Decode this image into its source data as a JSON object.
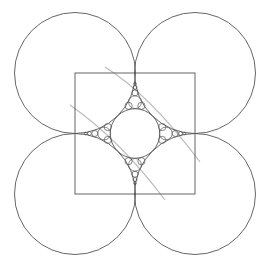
{
  "diagram": {
    "title": "",
    "colors": {
      "background": "#ffffff",
      "stroke": "#555555",
      "guide_arc": "#bbbbbb"
    },
    "square": {
      "x": 75,
      "y": 73,
      "width": 120,
      "height": 121
    },
    "large_circles": [
      {
        "name": "top-left",
        "cx": 75,
        "cy": 73,
        "r": 60.5
      },
      {
        "name": "top-right",
        "cx": 195,
        "cy": 73,
        "r": 60.5
      },
      {
        "name": "bottom-left",
        "cx": 75,
        "cy": 194,
        "r": 60.5
      },
      {
        "name": "bottom-right",
        "cx": 195,
        "cy": 194,
        "r": 60.5
      }
    ],
    "central_circle": {
      "cx": 135,
      "cy": 133.5,
      "r": 24.8
    },
    "cusp_circles": {
      "top": [
        {
          "cx": 135,
          "cy": 102.2,
          "r": 6.4
        },
        {
          "cx": 128.6,
          "cy": 105.8,
          "r": 3.6
        },
        {
          "cx": 141.4,
          "cy": 105.8,
          "r": 3.6
        },
        {
          "cx": 135,
          "cy": 92.8,
          "r": 3.0
        },
        {
          "cx": 135,
          "cy": 87.4,
          "r": 2.0
        },
        {
          "cx": 135,
          "cy": 83.8,
          "r": 1.4
        }
      ],
      "bottom": [
        {
          "cx": 135,
          "cy": 164.8,
          "r": 6.4
        },
        {
          "cx": 128.6,
          "cy": 161.2,
          "r": 3.6
        },
        {
          "cx": 141.4,
          "cy": 161.2,
          "r": 3.6
        },
        {
          "cx": 135,
          "cy": 174.2,
          "r": 3.0
        },
        {
          "cx": 135,
          "cy": 179.6,
          "r": 2.0
        },
        {
          "cx": 135,
          "cy": 183.2,
          "r": 1.4
        }
      ],
      "left": [
        {
          "cx": 104.2,
          "cy": 133.5,
          "r": 6.4
        },
        {
          "cx": 107.8,
          "cy": 127.1,
          "r": 3.6
        },
        {
          "cx": 107.8,
          "cy": 139.9,
          "r": 3.6
        },
        {
          "cx": 94.8,
          "cy": 133.5,
          "r": 3.0
        },
        {
          "cx": 89.4,
          "cy": 133.5,
          "r": 2.0
        },
        {
          "cx": 85.8,
          "cy": 133.5,
          "r": 1.4
        }
      ],
      "right": [
        {
          "cx": 165.8,
          "cy": 133.5,
          "r": 6.4
        },
        {
          "cx": 162.2,
          "cy": 127.1,
          "r": 3.6
        },
        {
          "cx": 162.2,
          "cy": 139.9,
          "r": 3.6
        },
        {
          "cx": 175.2,
          "cy": 133.5,
          "r": 3.0
        },
        {
          "cx": 180.6,
          "cy": 133.5,
          "r": 2.0
        },
        {
          "cx": 184.2,
          "cy": 133.5,
          "r": 1.4
        }
      ]
    },
    "guide_arcs": [
      {
        "name": "upper-guide-arc",
        "d": "M 105 67 Q 150 95 200 162"
      },
      {
        "name": "lower-guide-arc",
        "d": "M 70 105 Q 120 140 165 200"
      }
    ]
  }
}
